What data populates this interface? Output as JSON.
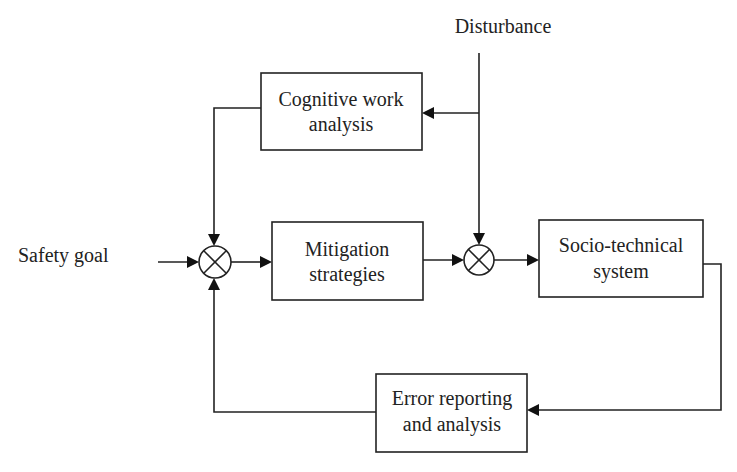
{
  "diagram": {
    "type": "control-loop block diagram",
    "inputs": {
      "safety_goal": "Safety goal",
      "disturbance": "Disturbance"
    },
    "blocks": {
      "cognitive_work_analysis": {
        "line1": "Cognitive work",
        "line2": "analysis"
      },
      "mitigation_strategies": {
        "line1": "Mitigation",
        "line2": "strategies"
      },
      "socio_technical_system": {
        "line1": "Socio-technical",
        "line2": "system"
      },
      "error_reporting": {
        "line1": "Error reporting",
        "line2": "and analysis"
      }
    },
    "junctions": [
      {
        "id": "summing-junction-1",
        "symbol": "multiply-cross"
      },
      {
        "id": "summing-junction-2",
        "symbol": "multiply-cross"
      }
    ],
    "connections": [
      {
        "from": "Safety goal",
        "to": "summing-junction-1"
      },
      {
        "from": "Cognitive work analysis",
        "to": "summing-junction-1"
      },
      {
        "from": "Error reporting and analysis",
        "to": "summing-junction-1"
      },
      {
        "from": "summing-junction-1",
        "to": "Mitigation strategies"
      },
      {
        "from": "Mitigation strategies",
        "to": "summing-junction-2"
      },
      {
        "from": "Disturbance",
        "to": "summing-junction-2"
      },
      {
        "from": "Disturbance",
        "to": "Cognitive work analysis"
      },
      {
        "from": "summing-junction-2",
        "to": "Socio-technical system"
      },
      {
        "from": "Socio-technical system",
        "to": "Error reporting and analysis"
      }
    ]
  }
}
